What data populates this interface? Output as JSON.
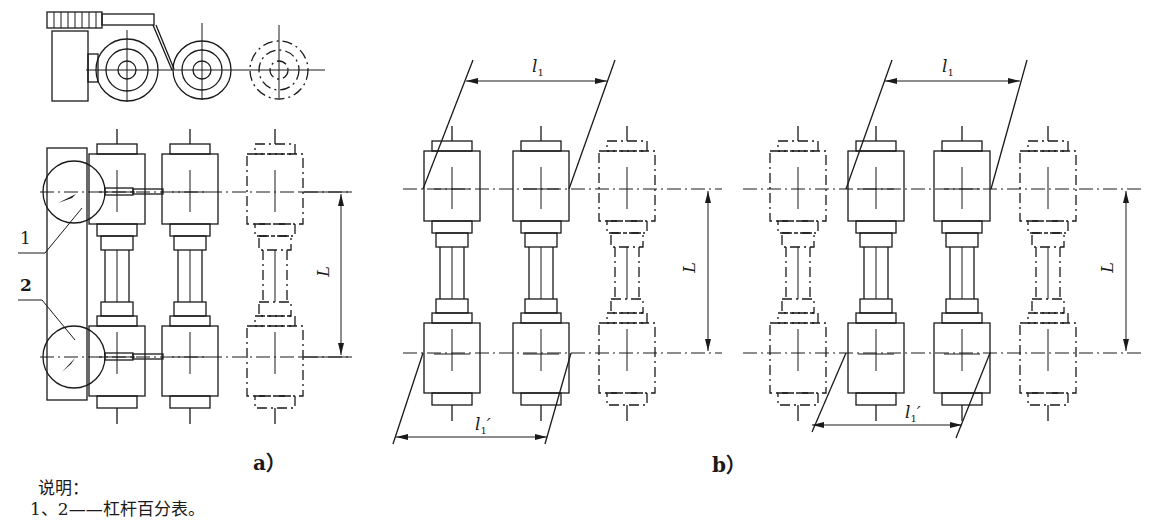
{
  "figure": {
    "panel_a": {
      "caption": "a）",
      "callouts": [
        "1",
        "2"
      ],
      "dimension_label": "L"
    },
    "panel_b_left": {
      "caption": "b）",
      "top_dimension": {
        "symbol": "l",
        "subscript": "1"
      },
      "bottom_dimension": {
        "symbol": "l",
        "subscript": "1",
        "prime": "′"
      },
      "dimension_label": "L"
    },
    "panel_b_right": {
      "top_dimension": {
        "symbol": "l",
        "subscript": "1"
      },
      "bottom_dimension": {
        "symbol": "l",
        "subscript": "1",
        "prime": "′"
      },
      "dimension_label": "L"
    }
  },
  "notes": {
    "heading": "说明：",
    "line1": "1、2——杠杆百分表。"
  }
}
